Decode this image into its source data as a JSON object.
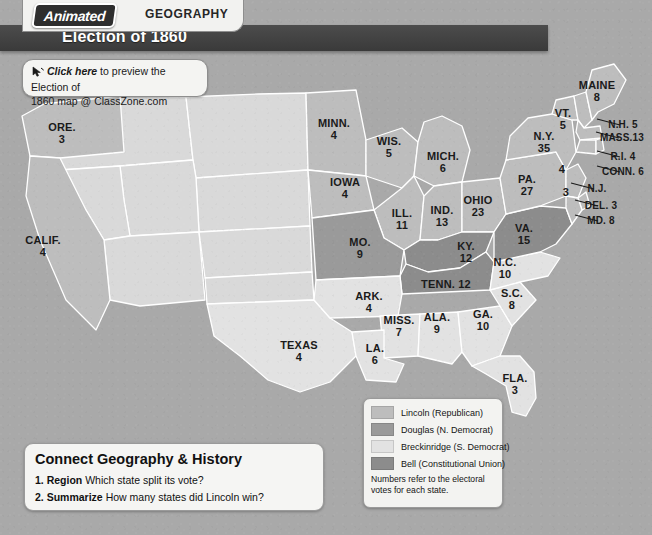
{
  "header": {
    "logo_text": "Animated",
    "section": "GEOGRAPHY",
    "title": "Election of 1860",
    "cursor_icon": "click-cursor-icon",
    "click_link": "Click here",
    "click_rest": " to preview the Election of",
    "click_line2": "1860 map @ ClassZone.com"
  },
  "legend": {
    "items": [
      {
        "label": "Lincoln (Republican)",
        "color": "#bdbdbd"
      },
      {
        "label": "Douglas (N. Democrat)",
        "color": "#9a9a9a"
      },
      {
        "label": "Breckinridge (S. Democrat)",
        "color": "#e2e2e2"
      },
      {
        "label": "Bell (Constitutional Union)",
        "color": "#8c8c8c"
      }
    ],
    "footnote_line1": "Numbers refer to the electoral",
    "footnote_line2": "votes for each state."
  },
  "connect": {
    "heading": "Connect Geography & History",
    "questions": [
      {
        "num": "1.",
        "term": "Region",
        "text": "Which state split its vote?"
      },
      {
        "num": "2.",
        "term": "Summarize",
        "text": "How many states did Lincoln win?"
      }
    ]
  },
  "map": {
    "colors": {
      "lincoln": "#bdbdbd",
      "douglas": "#9a9a9a",
      "breckinridge": "#e2e2e2",
      "bell": "#8c8c8c",
      "territory": "#d9d9d9",
      "border": "#ffffff",
      "background": "#a9a9a9"
    },
    "states": [
      {
        "name": "ORE.",
        "votes": "3",
        "party": "lincoln",
        "x": 62,
        "y": 131
      },
      {
        "name": "CALIF.",
        "votes": "4",
        "party": "lincoln",
        "x": 43,
        "y": 244
      },
      {
        "name": "TEXAS",
        "votes": "4",
        "party": "breckinridge",
        "x": 299,
        "y": 349
      },
      {
        "name": "MINN.",
        "votes": "4",
        "party": "lincoln",
        "x": 334,
        "y": 127
      },
      {
        "name": "WIS.",
        "votes": "5",
        "party": "lincoln",
        "x": 389,
        "y": 145
      },
      {
        "name": "IOWA",
        "votes": "4",
        "party": "lincoln",
        "x": 345,
        "y": 186
      },
      {
        "name": "MICH.",
        "votes": "6",
        "party": "lincoln",
        "x": 443,
        "y": 160
      },
      {
        "name": "ILL.",
        "votes": "11",
        "party": "lincoln",
        "x": 402,
        "y": 217
      },
      {
        "name": "IND.",
        "votes": "13",
        "party": "lincoln",
        "x": 442,
        "y": 214
      },
      {
        "name": "OHIO",
        "votes": "23",
        "party": "lincoln",
        "x": 478,
        "y": 204
      },
      {
        "name": "MO.",
        "votes": "9",
        "party": "douglas",
        "x": 360,
        "y": 246
      },
      {
        "name": "KY.",
        "votes": "12",
        "party": "bell",
        "x": 466,
        "y": 250
      },
      {
        "name": "ARK.",
        "votes": "4",
        "party": "breckinridge",
        "x": 369,
        "y": 300
      },
      {
        "name": "MISS.",
        "votes": "7",
        "party": "breckinridge",
        "x": 399,
        "y": 324
      },
      {
        "name": "ALA.",
        "votes": "9",
        "party": "breckinridge",
        "x": 437,
        "y": 321
      },
      {
        "name": "GA.",
        "votes": "10",
        "party": "breckinridge",
        "x": 483,
        "y": 318
      },
      {
        "name": "LA.",
        "votes": "6",
        "party": "breckinridge",
        "x": 375,
        "y": 352
      },
      {
        "name": "FLA.",
        "votes": "3",
        "party": "breckinridge",
        "x": 515,
        "y": 382
      },
      {
        "name": "S.C.",
        "votes": "8",
        "party": "breckinridge",
        "x": 512,
        "y": 297
      },
      {
        "name": "N.C.",
        "votes": "10",
        "party": "breckinridge",
        "x": 505,
        "y": 266
      },
      {
        "name": "VA.",
        "votes": "15",
        "party": "bell",
        "x": 524,
        "y": 232
      },
      {
        "name": "PA.",
        "votes": "27",
        "party": "lincoln",
        "x": 527,
        "y": 183
      },
      {
        "name": "N.Y.",
        "votes": "35",
        "party": "lincoln",
        "x": 544,
        "y": 140
      },
      {
        "name": "VT.",
        "votes": "5",
        "party": "lincoln",
        "x": 563,
        "y": 117
      },
      {
        "name": "MAINE",
        "votes": "8",
        "party": "lincoln",
        "x": 597,
        "y": 89
      }
    ],
    "callouts": [
      {
        "name": "N.H. 5",
        "x": 623,
        "y": 128,
        "onmap": "",
        "mx": 0,
        "my": 0
      },
      {
        "name": "MASS.13",
        "x": 622,
        "y": 141,
        "onmap": "",
        "mx": 0,
        "my": 0
      },
      {
        "name": "R.I. 4",
        "x": 623,
        "y": 160,
        "onmap": "",
        "mx": 0,
        "my": 0
      },
      {
        "name": "CONN. 6",
        "x": 623,
        "y": 175,
        "onmap": "4",
        "mx": 562,
        "my": 173
      },
      {
        "name": "N.J.",
        "x": 597,
        "y": 192,
        "onmap": "3",
        "mx": 566,
        "my": 196
      },
      {
        "name": "DEL. 3",
        "x": 601,
        "y": 209,
        "onmap": "",
        "mx": 0,
        "my": 0
      },
      {
        "name": "MD. 8",
        "x": 601,
        "y": 224,
        "onmap": "",
        "mx": 0,
        "my": 0
      }
    ]
  }
}
